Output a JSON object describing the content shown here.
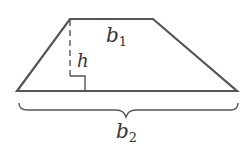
{
  "diagram": {
    "stroke_color": "#555555",
    "labels": {
      "top_base": {
        "main": "b",
        "sub": "1"
      },
      "height": {
        "main": "h"
      },
      "bottom_base": {
        "main": "b",
        "sub": "2"
      }
    }
  }
}
